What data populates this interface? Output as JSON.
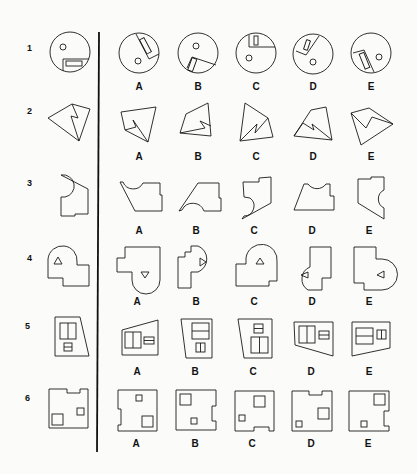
{
  "test": {
    "title": "Spatial reasoning — rotated figure matching",
    "divider_color": "#111111",
    "problems": [
      {
        "number": "1",
        "stimulus": "circle-with-notch-rect-and-dot",
        "options": [
          "A",
          "B",
          "C",
          "D",
          "E"
        ]
      },
      {
        "number": "2",
        "stimulus": "quadrilateral-with-zigzag",
        "options": [
          "A",
          "B",
          "C",
          "D",
          "E"
        ]
      },
      {
        "number": "3",
        "stimulus": "polygon-with-semicircle-cutout",
        "options": [
          "A",
          "B",
          "C",
          "D",
          "E"
        ]
      },
      {
        "number": "4",
        "stimulus": "keyhole-shape-with-triangle",
        "options": [
          "A",
          "B",
          "C",
          "D",
          "E"
        ]
      },
      {
        "number": "5",
        "stimulus": "trapezoid-with-windows",
        "options": [
          "A",
          "B",
          "C",
          "D",
          "E"
        ]
      },
      {
        "number": "6",
        "stimulus": "notched-square-with-squares",
        "options": [
          "A",
          "B",
          "C",
          "D",
          "E"
        ]
      }
    ]
  }
}
